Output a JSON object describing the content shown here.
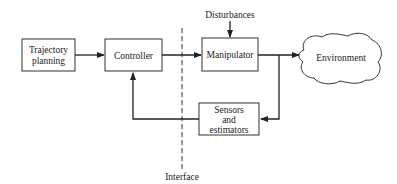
{
  "diagram": {
    "type": "block-diagram",
    "nodes": {
      "trajectory": {
        "line1": "Trajectory",
        "line2": "planning"
      },
      "controller": {
        "label": "Controller"
      },
      "manipulator": {
        "label": "Manipulator"
      },
      "environment": {
        "label": "Environment"
      },
      "sensors": {
        "line1": "Sensors",
        "line2": "and",
        "line3": "estimators"
      }
    },
    "labels": {
      "disturbances": "Disturbances",
      "interface": "Interface"
    },
    "edges": [
      {
        "from": "Trajectory planning",
        "to": "Controller"
      },
      {
        "from": "Controller",
        "to": "Manipulator"
      },
      {
        "from": "Disturbances",
        "to": "Manipulator"
      },
      {
        "from": "Manipulator",
        "to": "Environment"
      },
      {
        "from": "Manipulator output",
        "to": "Sensors and estimators"
      },
      {
        "from": "Sensors and estimators",
        "to": "Controller"
      }
    ]
  }
}
